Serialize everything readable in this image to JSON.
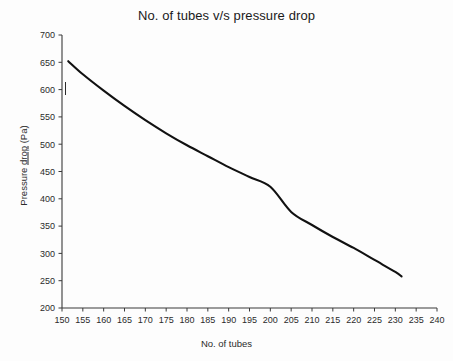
{
  "chart_data": {
    "type": "line",
    "title": "No. of tubes v/s pressure drop",
    "xlabel": "No. of tubes",
    "ylabel_parts": {
      "before": "Pressure ",
      "underlined": "drop",
      "after": " (Pa)"
    },
    "ylabel": "Pressure drop (Pa)",
    "xlim": [
      150,
      240
    ],
    "ylim": [
      200,
      700
    ],
    "xticks": [
      150,
      155,
      160,
      165,
      170,
      175,
      180,
      185,
      190,
      195,
      200,
      205,
      210,
      215,
      220,
      225,
      230,
      235,
      240
    ],
    "yticks": [
      200,
      250,
      300,
      350,
      400,
      450,
      500,
      550,
      600,
      650,
      700
    ],
    "grid": false,
    "legend": false,
    "series": [
      {
        "name": "Pressure drop",
        "color": "#111111",
        "x": [
          151.5,
          155,
          160,
          165,
          170,
          175,
          180,
          185,
          190,
          195,
          200,
          205,
          210,
          215,
          220,
          225,
          230,
          231.5
        ],
        "values": [
          652,
          630,
          600,
          572,
          545,
          520,
          497,
          476,
          456,
          437,
          418,
          400,
          383,
          340,
          320,
          302,
          285,
          258
        ]
      }
    ]
  },
  "curve_points": [
    {
      "x": 151.5,
      "y": 652
    },
    {
      "x": 155,
      "y": 628
    },
    {
      "x": 160,
      "y": 598
    },
    {
      "x": 165,
      "y": 570
    },
    {
      "x": 170,
      "y": 544
    },
    {
      "x": 175,
      "y": 520
    },
    {
      "x": 180,
      "y": 498
    },
    {
      "x": 185,
      "y": 478
    },
    {
      "x": 190,
      "y": 458
    },
    {
      "x": 195,
      "y": 440
    },
    {
      "x": 200,
      "y": 422
    },
    {
      "x": 205,
      "y": 376
    },
    {
      "x": 210,
      "y": 352
    },
    {
      "x": 215,
      "y": 330
    },
    {
      "x": 220,
      "y": 310
    },
    {
      "x": 225,
      "y": 288
    },
    {
      "x": 230,
      "y": 266
    },
    {
      "x": 231.5,
      "y": 258
    }
  ],
  "geometry": {
    "x_left_px": 62,
    "x_right_px": 437,
    "y_top_px": 35,
    "y_bottom_px": 308
  }
}
